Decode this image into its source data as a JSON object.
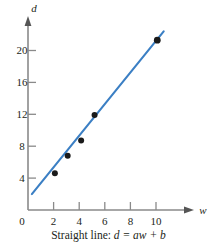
{
  "chart_data": {
    "type": "scatter",
    "title": "",
    "caption_prefix": "Straight line:",
    "caption_equation": "d = aw + b",
    "xlabel": "w",
    "ylabel": "d",
    "xlim": [
      0,
      11.6
    ],
    "ylim": [
      0,
      23.5
    ],
    "xticks": [
      0,
      2,
      4,
      6,
      8,
      10
    ],
    "yticks": [
      0,
      4,
      8,
      12,
      16,
      20
    ],
    "xticklabels": [
      "0",
      "2",
      "4",
      "6",
      "8",
      "10"
    ],
    "yticklabels": [
      "0",
      "4",
      "8",
      "12",
      "16",
      "20"
    ],
    "grid": false,
    "legend": null,
    "points": [
      {
        "x": 2.1,
        "y": 4.6
      },
      {
        "x": 3.1,
        "y": 6.8
      },
      {
        "x": 4.15,
        "y": 8.7
      },
      {
        "x": 5.2,
        "y": 11.9
      },
      {
        "x": 10.1,
        "y": 21.3
      }
    ],
    "fit_line": {
      "name": "least-squares straight line",
      "x_start": 0.3,
      "y_start": 2.0,
      "x_end": 10.6,
      "y_end": 22.4,
      "slope": 1.98,
      "intercept": 1.41,
      "color": "#3b7fc4"
    },
    "marker_color": "#1a1a1a",
    "axis_color": "#7f7f7f"
  },
  "axes": {
    "y_axis_name": "d",
    "x_axis_name": "w"
  }
}
